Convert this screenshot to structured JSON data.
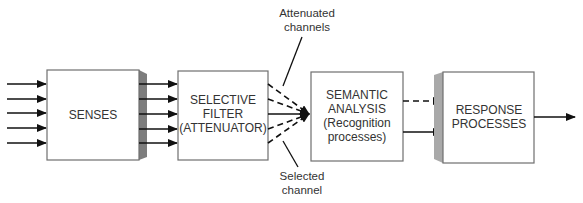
{
  "diagram": {
    "title": "",
    "boxes": [
      {
        "id": "senses",
        "lines": [
          "SENSES"
        ]
      },
      {
        "id": "filter",
        "lines": [
          "SELECTIVE",
          "FILTER",
          "(ATTENUATOR)"
        ]
      },
      {
        "id": "semantic",
        "lines": [
          "SEMANTIC",
          "ANALYSIS",
          "(Recognition",
          "processes)"
        ]
      },
      {
        "id": "response",
        "lines": [
          "RESPONSE",
          "PROCESSES"
        ]
      }
    ],
    "callouts": {
      "attenuated": [
        "Attenuated",
        "channels"
      ],
      "selected": [
        "Selected",
        "channel"
      ]
    },
    "edges": {
      "inputs_to_senses": 5,
      "senses_to_filter": 5,
      "filter_to_semantic_dashed": 4,
      "filter_to_semantic_solid": 1,
      "semantic_to_response": [
        "dashed",
        "solid"
      ],
      "response_output": 1
    },
    "colors": {
      "stroke": "#111111",
      "box_border": "#6f6f6f",
      "shadow": "#7d7d7d",
      "text": "#333333"
    }
  }
}
